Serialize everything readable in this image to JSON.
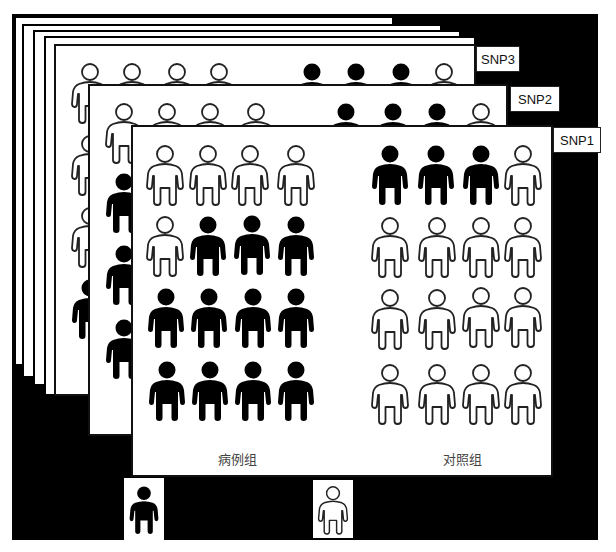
{
  "figure": {
    "colors": {
      "background": "#000000",
      "panel": "#ffffff",
      "filled": "#000000",
      "outline": "#222222"
    },
    "layers": [
      {
        "id": "SNP3",
        "label": "SNP3"
      },
      {
        "id": "SNP2",
        "label": "SNP2"
      },
      {
        "id": "SNP1",
        "label": "SNP1"
      }
    ],
    "groups": {
      "case": {
        "label": "病例组"
      },
      "control": {
        "label": "对照组"
      }
    },
    "snp1": {
      "label": "SNP1",
      "case_grid": [
        [
          "outline",
          "outline",
          "outline",
          "outline"
        ],
        [
          "outline",
          "filled",
          "filled",
          "filled"
        ],
        [
          "filled",
          "filled",
          "filled",
          "filled"
        ],
        [
          "filled",
          "filled",
          "filled",
          "filled"
        ]
      ],
      "control_grid": [
        [
          "filled",
          "filled",
          "filled",
          "outline"
        ],
        [
          "outline",
          "outline",
          "outline",
          "outline"
        ],
        [
          "outline",
          "outline",
          "outline",
          "outline"
        ],
        [
          "outline",
          "outline",
          "outline",
          "outline"
        ]
      ],
      "case_filled_count": 11,
      "control_filled_count": 3
    },
    "snp2": {
      "label": "SNP2",
      "visible_case_left_column": [
        "outline",
        "filled",
        "filled",
        "filled"
      ],
      "visible_case_top_row": [
        "outline",
        "outline",
        "outline",
        "outline"
      ],
      "visible_control_top_row": [
        "filled",
        "filled",
        "filled",
        "outline"
      ]
    },
    "snp3": {
      "label": "SNP3",
      "visible_case_left_column": [
        "outline",
        "outline",
        "outline",
        "filled"
      ],
      "visible_case_top_row": [
        "outline",
        "outline",
        "outline",
        "outline"
      ],
      "visible_control_top_row": [
        "filled",
        "filled",
        "filled",
        "outline"
      ]
    },
    "legend": [
      {
        "type": "filled",
        "meaning": "carrier"
      },
      {
        "type": "outline",
        "meaning": "non-carrier"
      }
    ]
  }
}
